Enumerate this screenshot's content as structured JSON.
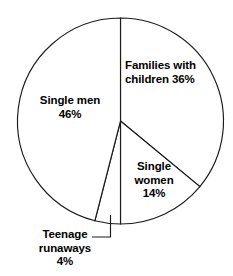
{
  "chart_data": {
    "type": "pie",
    "title": "",
    "subtitle": "",
    "xlabel": "",
    "ylabel": "",
    "grid": false,
    "legend_position": "none",
    "label_placement": "inside-slices-with-leader-for-smallest",
    "start_angle_deg": 0,
    "direction": "clockwise",
    "center": {
      "x": 120.5,
      "y": 121
    },
    "radius": 103,
    "categories": [
      "Families with children",
      "Single women",
      "Teenage runaways",
      "Single men"
    ],
    "values": [
      36,
      14,
      4,
      46
    ],
    "units": "percent",
    "total": 100,
    "slices": [
      {
        "name": "families-with-children",
        "label_line_1": "Families with",
        "label_line_2": "children 36%",
        "value": 36,
        "value_text": "36%",
        "start_deg": 0,
        "end_deg": 129.6,
        "fill": "#ffffff",
        "stroke": "#1a1a1a",
        "leader": false
      },
      {
        "name": "single-women",
        "label_line_1": "Single",
        "label_line_2": "women",
        "label_line_3": "14%",
        "value": 14,
        "value_text": "14%",
        "start_deg": 129.6,
        "end_deg": 180.0,
        "fill": "#ffffff",
        "stroke": "#1a1a1a",
        "leader": false
      },
      {
        "name": "teenage-runaways",
        "label_line_1": "Teenage",
        "label_line_2": "runaways",
        "label_line_3": "4%",
        "value": 4,
        "value_text": "4%",
        "start_deg": 180.0,
        "end_deg": 194.4,
        "fill": "#ffffff",
        "stroke": "#1a1a1a",
        "leader": true
      },
      {
        "name": "single-men",
        "label_line_1": "Single men",
        "label_line_2": "46%",
        "value": 46,
        "value_text": "46%",
        "start_deg": 194.4,
        "end_deg": 360.0,
        "fill": "#ffffff",
        "stroke": "#1a1a1a",
        "leader": false
      }
    ]
  },
  "labels": {
    "families": {
      "line1": "Families with",
      "line2": "children 36%"
    },
    "single_men": {
      "line1": "Single men",
      "line2": "46%"
    },
    "single_women": {
      "line1": "Single",
      "line2": "women",
      "line3": "14%"
    },
    "runaways": {
      "line1": "Teenage",
      "line2": "runaways",
      "line3": "4%"
    }
  },
  "colors": {
    "background": "#ffffff",
    "outline": "#1a1a1a",
    "text": "#000000"
  }
}
